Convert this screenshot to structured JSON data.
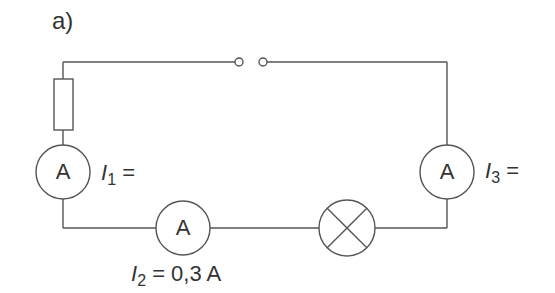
{
  "figure": {
    "label": "a)"
  },
  "colors": {
    "line": "#555555",
    "text": "#333333",
    "background": "#ffffff"
  },
  "components": {
    "resistor": {
      "type": "resistor"
    },
    "switch": {
      "type": "open-switch"
    },
    "lamp": {
      "type": "lamp"
    },
    "ammeter_1": {
      "symbol": "A",
      "current_symbol": "I",
      "subscript": "1",
      "value_text": "="
    },
    "ammeter_2": {
      "symbol": "A",
      "current_symbol": "I",
      "subscript": "2",
      "value_text": "= 0,3 A"
    },
    "ammeter_3": {
      "symbol": "A",
      "current_symbol": "I",
      "subscript": "3",
      "value_text": "="
    }
  }
}
